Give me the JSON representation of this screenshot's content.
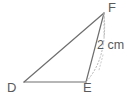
{
  "figure": {
    "type": "geometry-diagram",
    "shape": "triangle",
    "stroke_color": "#6e6e6e",
    "dashed_color": "#b0b0b0",
    "text_color": "#5a5a5a",
    "background": "#ffffff",
    "vertices": [
      {
        "id": "D",
        "label": "D",
        "x": 24,
        "y": 82
      },
      {
        "id": "E",
        "label": "E",
        "x": 86,
        "y": 82
      },
      {
        "id": "F",
        "label": "F",
        "x": 104,
        "y": 13
      }
    ],
    "edges": [
      {
        "from": "D",
        "to": "F",
        "style": "solid"
      },
      {
        "from": "D",
        "to": "E",
        "style": "solid"
      },
      {
        "from": "E",
        "to": "F",
        "style": "solid"
      }
    ],
    "dashed_marks": [
      {
        "id": "arc-EF",
        "description": "dotted arc from F curving to E"
      },
      {
        "id": "tick-F",
        "description": "short dotted vertical tick below F"
      }
    ],
    "measurements": [
      {
        "id": "EF-length",
        "text": "2 cm",
        "edge": "E-F"
      }
    ]
  }
}
